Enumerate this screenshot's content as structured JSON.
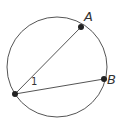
{
  "diagram": {
    "type": "circle-inscribed-angle",
    "circle": {
      "cx": 57,
      "cy": 67,
      "r": 50,
      "stroke": "#555555"
    },
    "points": {
      "vertex": {
        "x": 15,
        "y": 94,
        "label": ""
      },
      "A": {
        "x": 81,
        "y": 27,
        "label": "A",
        "label_x": 84,
        "label_y": 21
      },
      "B": {
        "x": 104,
        "y": 79,
        "label": "B",
        "label_x": 107,
        "label_y": 84
      }
    },
    "chords": [
      {
        "from": "vertex",
        "to": "A"
      },
      {
        "from": "vertex",
        "to": "B"
      }
    ],
    "angle_label": {
      "text": "1",
      "x": 31,
      "y": 85
    },
    "colors": {
      "line": "#555555",
      "point": "#222222",
      "text": "#333333"
    }
  }
}
